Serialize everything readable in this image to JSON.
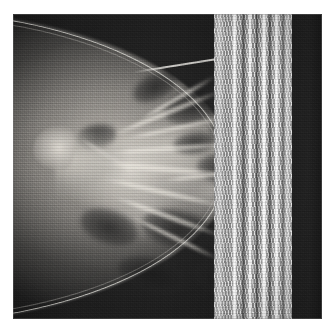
{
  "viewer": {
    "name": "medical-image-viewer",
    "background_color": "#ffffff",
    "canvas_width": 334,
    "canvas_height": 329
  },
  "image": {
    "modality": "mammography-xray",
    "view_description": "breast in profile, nipple pointing left",
    "plate": {
      "left": 13,
      "top": 14,
      "width": 309,
      "height": 305
    },
    "colors": {
      "film_background": "#1b1b1b",
      "soft_tissue": "#a8a49e",
      "dense_tissue": "#e2ded6",
      "skin_line": "#e8e6e0",
      "artifact_bright": "#ffffff",
      "artifact_mid": "#b9b9b9",
      "artifact_dark": "#6a6a6a"
    },
    "regions": [
      {
        "id": "background-field",
        "label": "dark background field"
      },
      {
        "id": "breast-mound",
        "label": "breast soft tissue mound"
      },
      {
        "id": "skin-line",
        "label": "skin line contour"
      },
      {
        "id": "nipple",
        "label": "nipple in profile"
      },
      {
        "id": "glandular-tissue",
        "label": "fibroglandular dense tissue"
      },
      {
        "id": "fat-lobules",
        "label": "radiolucent fatty lobules"
      },
      {
        "id": "trabecular-strands",
        "label": "trabecular / Cooper ligament strands"
      },
      {
        "id": "artifact-band",
        "label": "vertical striped detector artifact band"
      }
    ],
    "artifact_band": {
      "left": 214,
      "width": 78,
      "bright_stripes": [
        {
          "left": 232,
          "width": 5
        },
        {
          "left": 248,
          "width": 4
        },
        {
          "left": 261,
          "width": 6
        },
        {
          "left": 274,
          "width": 5
        }
      ],
      "dark_stripes": [
        {
          "left": 241,
          "width": 5
        },
        {
          "left": 255,
          "width": 4
        },
        {
          "left": 268,
          "width": 4
        },
        {
          "left": 281,
          "width": 5
        }
      ]
    },
    "strands": [
      {
        "left": 95,
        "top": 96,
        "width": 120,
        "height": 5,
        "rotate": -22
      },
      {
        "left": 110,
        "top": 112,
        "width": 108,
        "height": 4,
        "rotate": -12
      },
      {
        "left": 90,
        "top": 132,
        "width": 135,
        "height": 5,
        "rotate": -4
      },
      {
        "left": 78,
        "top": 152,
        "width": 145,
        "height": 6,
        "rotate": 5
      },
      {
        "left": 86,
        "top": 176,
        "width": 130,
        "height": 5,
        "rotate": 13
      },
      {
        "left": 96,
        "top": 200,
        "width": 118,
        "height": 5,
        "rotate": 20
      },
      {
        "left": 112,
        "top": 222,
        "width": 100,
        "height": 4,
        "rotate": 26
      },
      {
        "left": 120,
        "top": 82,
        "width": 90,
        "height": 4,
        "rotate": -30
      },
      {
        "left": 60,
        "top": 140,
        "width": 70,
        "height": 4,
        "rotate": 32
      },
      {
        "left": 150,
        "top": 160,
        "width": 80,
        "height": 4,
        "rotate": -6
      }
    ],
    "lobules": [
      {
        "left": 150,
        "top": 74,
        "width": 62,
        "height": 34,
        "rotate": -20
      },
      {
        "left": 196,
        "top": 96,
        "width": 52,
        "height": 30,
        "rotate": -14
      },
      {
        "left": 118,
        "top": 60,
        "width": 48,
        "height": 26,
        "rotate": -26
      },
      {
        "left": 184,
        "top": 140,
        "width": 58,
        "height": 30,
        "rotate": 6
      },
      {
        "left": 66,
        "top": 196,
        "width": 60,
        "height": 34,
        "rotate": 18
      },
      {
        "left": 128,
        "top": 196,
        "width": 72,
        "height": 38,
        "rotate": 12
      },
      {
        "left": 196,
        "top": 210,
        "width": 56,
        "height": 32,
        "rotate": 16
      },
      {
        "left": 104,
        "top": 244,
        "width": 74,
        "height": 34,
        "rotate": 14
      },
      {
        "left": 178,
        "top": 250,
        "width": 58,
        "height": 28,
        "rotate": 10
      },
      {
        "left": 64,
        "top": 110,
        "width": 40,
        "height": 24,
        "rotate": -10
      },
      {
        "left": 210,
        "top": 60,
        "width": 40,
        "height": 24,
        "rotate": -18
      },
      {
        "left": 160,
        "top": 118,
        "width": 44,
        "height": 22,
        "rotate": -8
      }
    ]
  }
}
